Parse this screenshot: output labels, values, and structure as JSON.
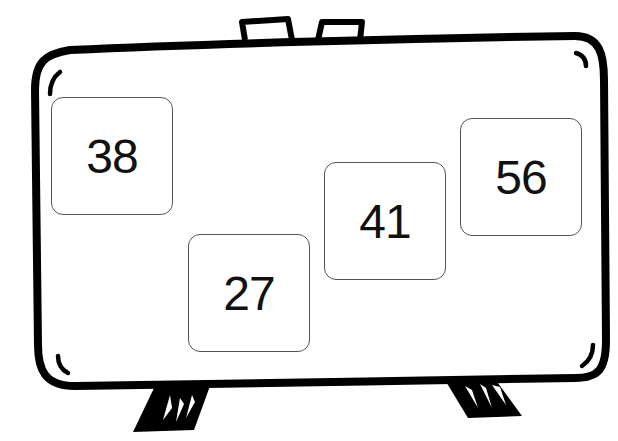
{
  "scene": {
    "type": "cartoon-suitcase-with-number-cards",
    "stroke_color": "#000000",
    "background_color": "#ffffff"
  },
  "cards": [
    {
      "value": "38",
      "x": 51,
      "y": 97
    },
    {
      "value": "27",
      "x": 188,
      "y": 234
    },
    {
      "value": "41",
      "x": 324,
      "y": 162
    },
    {
      "value": "56",
      "x": 460,
      "y": 118
    }
  ]
}
